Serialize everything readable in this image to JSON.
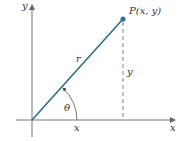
{
  "diagram": {
    "axes": {
      "x_label": "x",
      "y_label": "y"
    },
    "point": {
      "label": "P(x, y)",
      "color": "#2a7a86"
    },
    "segment": {
      "label": "r",
      "color": "#2e6f88"
    },
    "vertical_label": "y",
    "horizontal_label": "x",
    "angle_label": "θ"
  }
}
